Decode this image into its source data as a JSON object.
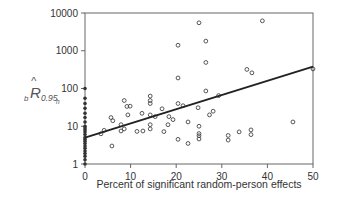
{
  "chart_data": {
    "type": "scatter",
    "title": "",
    "xlabel": "Percent of significant random-person effects",
    "ylabel": "b R̂ 0.95h",
    "ylabel_parts": {
      "prefix_sub": "b",
      "main": "R",
      "sub": "0.95",
      "subsub": "h"
    },
    "xlim": [
      0,
      50
    ],
    "ylim": [
      1,
      10000
    ],
    "yscale": "log",
    "grid": false,
    "legend": null,
    "x_ticks": [
      0,
      10,
      20,
      30,
      40,
      50
    ],
    "x_tick_labels": [
      "0",
      "10",
      "20",
      "30",
      "40",
      "50"
    ],
    "y_ticks": [
      1,
      10,
      100,
      1000,
      10000
    ],
    "y_tick_labels": [
      "1",
      "10",
      "100",
      "1000",
      "10000"
    ],
    "regression_line": {
      "x": [
        0,
        50
      ],
      "y": [
        5,
        380
      ]
    },
    "series": [
      {
        "name": "zero-percent (filled)",
        "marker": "filled-dot",
        "points": [
          [
            0,
            100
          ],
          [
            0,
            55
          ],
          [
            0,
            40
          ],
          [
            0,
            30
          ],
          [
            0,
            22
          ],
          [
            0,
            17
          ],
          [
            0,
            13
          ],
          [
            0,
            10
          ],
          [
            0,
            9
          ],
          [
            0,
            8
          ],
          [
            0,
            7
          ],
          [
            0,
            6
          ],
          [
            0,
            5
          ],
          [
            0,
            4.5
          ],
          [
            0,
            4
          ],
          [
            0,
            3.5
          ],
          [
            0,
            3
          ],
          [
            0,
            2.6
          ],
          [
            0,
            2.2
          ],
          [
            0,
            1.9
          ],
          [
            0,
            1.6
          ],
          [
            0,
            1.3
          ],
          [
            0,
            1
          ]
        ]
      },
      {
        "name": "observations",
        "marker": "open-circle",
        "points": [
          [
            3.5,
            6.3
          ],
          [
            4.2,
            7.8
          ],
          [
            5.7,
            17
          ],
          [
            6.1,
            14
          ],
          [
            5.9,
            3.0
          ],
          [
            7.9,
            7.5
          ],
          [
            7.9,
            11
          ],
          [
            8.6,
            48
          ],
          [
            8.6,
            8.5
          ],
          [
            9.2,
            33.5
          ],
          [
            9.4,
            20
          ],
          [
            9.9,
            34
          ],
          [
            11.4,
            7.3
          ],
          [
            12.5,
            22
          ],
          [
            12.7,
            7.5
          ],
          [
            14.3,
            63
          ],
          [
            14.3,
            20
          ],
          [
            14.3,
            11
          ],
          [
            14.3,
            8.5
          ],
          [
            14.3,
            40
          ],
          [
            14.3,
            48
          ],
          [
            15.4,
            18
          ],
          [
            16.9,
            29
          ],
          [
            17.3,
            7.2
          ],
          [
            18.2,
            11
          ],
          [
            18.4,
            18
          ],
          [
            19.3,
            15
          ],
          [
            20.4,
            40
          ],
          [
            20.4,
            190
          ],
          [
            20.4,
            1400
          ],
          [
            20.4,
            4.5
          ],
          [
            21.5,
            35
          ],
          [
            22.6,
            3.5
          ],
          [
            22.6,
            13
          ],
          [
            25,
            5500
          ],
          [
            24.8,
            31
          ],
          [
            25,
            10
          ],
          [
            25,
            6.4
          ],
          [
            25,
            5.6
          ],
          [
            25,
            4.6
          ],
          [
            26.5,
            1800
          ],
          [
            26.5,
            490
          ],
          [
            26.5,
            86
          ],
          [
            27.3,
            20
          ],
          [
            28.1,
            25
          ],
          [
            29.3,
            65
          ],
          [
            31.4,
            4.3
          ],
          [
            31.4,
            5.7
          ],
          [
            33.8,
            7.1
          ],
          [
            35.5,
            320
          ],
          [
            36.4,
            6.0
          ],
          [
            36.6,
            260
          ],
          [
            36.4,
            8.0
          ],
          [
            38.9,
            6200
          ],
          [
            45.6,
            13
          ],
          [
            50,
            330
          ]
        ]
      }
    ]
  }
}
